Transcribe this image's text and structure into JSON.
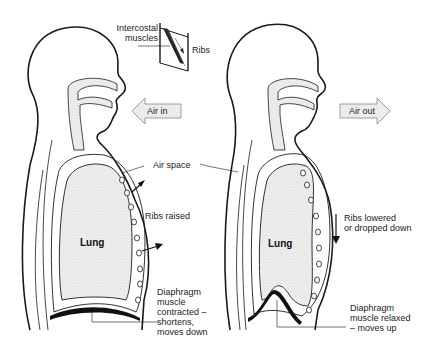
{
  "figure": {
    "panels": [
      {
        "id": "inhale",
        "air_arrow_label": "Air in",
        "air_arrow_direction": "left",
        "lung_label": "Lung",
        "ribs_label": "Ribs raised",
        "diaphragm_label_lines": [
          "Diaphragm",
          "muscle",
          "contracted –",
          "shortens,",
          "moves down"
        ]
      },
      {
        "id": "exhale",
        "air_arrow_label": "Air out",
        "air_arrow_direction": "right",
        "lung_label": "Lung",
        "ribs_label_lines": [
          "Ribs lowered",
          "or dropped down"
        ],
        "diaphragm_label_lines": [
          "Diaphragm",
          "muscle relaxed",
          "– moves up"
        ]
      }
    ],
    "inset": {
      "intercostal_label_lines": [
        "Intercostal",
        "muscles"
      ],
      "ribs_label": "Ribs"
    },
    "shared_label": "Air space",
    "colors": {
      "line": "#1a1a1a",
      "stipple_fill": "#e6e6e6",
      "arrow_fill": "#ececec"
    }
  }
}
